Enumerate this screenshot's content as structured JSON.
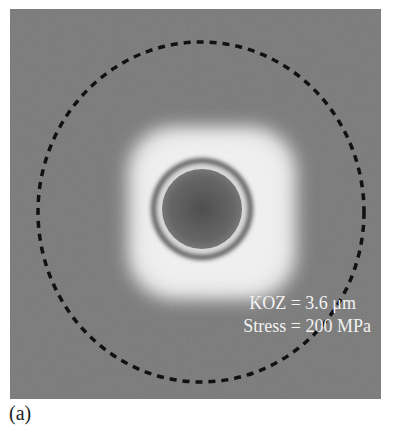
{
  "figure": {
    "panel_label": "(a)",
    "annotations": {
      "koz": "KOZ = 3.6 μm",
      "stress": "Stress = 200 MPa"
    },
    "colors": {
      "background": "#7a7a7a",
      "halo": "#e8e8e8",
      "ring_dark": "#555555",
      "ring_light": "#dcdcdc",
      "core": "#5a5a5a",
      "dashed_circle": "#111111"
    }
  }
}
